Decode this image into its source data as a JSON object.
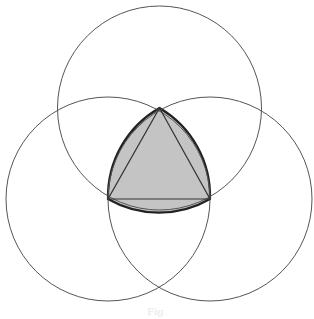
{
  "diagram": {
    "circle_radius": 102,
    "vertices": {
      "top": [
        159.5,
        108
      ],
      "bottom_left": [
        108,
        199
      ],
      "bottom_right": [
        210,
        199
      ]
    },
    "colors": {
      "stroke": "#3a3a3a",
      "fill": "#c4c4c4",
      "background": "#ffffff"
    }
  },
  "caption": "Fig."
}
